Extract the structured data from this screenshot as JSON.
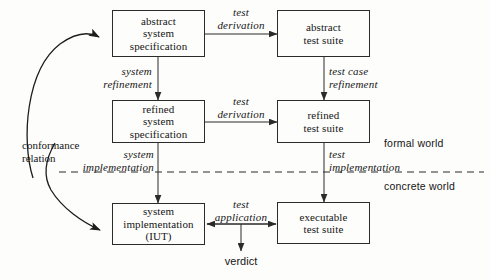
{
  "diagram": {
    "stroke_color": "#2b2b2b",
    "text_color": "#151515",
    "background": "#fdfdfc",
    "nodes": [
      {
        "id": "abstract-system-specification",
        "label": "abstract\nsystem\nspecification"
      },
      {
        "id": "abstract-test-suite",
        "label": "abstract\ntest suite"
      },
      {
        "id": "refined-system-specification",
        "label": "refined\nsystem\nspecification"
      },
      {
        "id": "refined-test-suite",
        "label": "refined\ntest suite"
      },
      {
        "id": "system-implementation-iut",
        "label": "system\nimplementation\n(IUT)"
      },
      {
        "id": "executable-test-suite",
        "label": "executable\ntest suite"
      }
    ],
    "edge_labels": [
      {
        "id": "test-derivation-top",
        "label": "test\nderivation"
      },
      {
        "id": "test-derivation-middle",
        "label": "test\nderivation"
      },
      {
        "id": "system-refinement",
        "label": "system\nrefinement"
      },
      {
        "id": "test-case-refinement",
        "label": "test case\nrefinement"
      },
      {
        "id": "system-implementation",
        "label": "system\nimplementation"
      },
      {
        "id": "test-implementation",
        "label": "test\nimplementation"
      },
      {
        "id": "test-application",
        "label": "test\napplication"
      },
      {
        "id": "conformance-relation",
        "label": "conformance\nrelation"
      }
    ],
    "annotations": [
      {
        "id": "formal-world",
        "label": "formal world"
      },
      {
        "id": "concrete-world",
        "label": "concrete world"
      },
      {
        "id": "verdict",
        "label": "verdict"
      }
    ]
  }
}
